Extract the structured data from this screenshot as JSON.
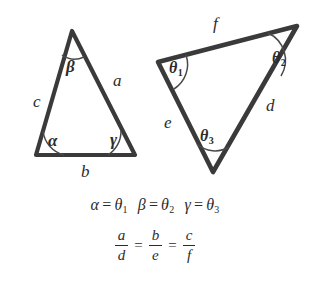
{
  "figure": {
    "stroke_color": "#3a3a3a",
    "text_color": "#2b2b2b",
    "background_color": "#ffffff"
  },
  "left_triangle": {
    "name": "small-triangle",
    "vertices": {
      "apex": [
        72,
        31
      ],
      "bottom_left": [
        36,
        155
      ],
      "bottom_right": [
        135,
        155
      ]
    },
    "angles": [
      {
        "id": "alpha",
        "label": "α",
        "vertex": "bottom_left"
      },
      {
        "id": "beta",
        "label": "β",
        "vertex": "apex"
      },
      {
        "id": "gamma",
        "label": "γ",
        "vertex": "bottom_right"
      }
    ],
    "sides": [
      {
        "id": "a",
        "label": "a",
        "between": "apex-bottom_right"
      },
      {
        "id": "b",
        "label": "b",
        "between": "bottom_left-bottom_right"
      },
      {
        "id": "c",
        "label": "c",
        "between": "apex-bottom_left"
      }
    ]
  },
  "right_triangle": {
    "name": "large-triangle",
    "vertices": {
      "left": [
        158,
        62
      ],
      "top_right": [
        297,
        26
      ],
      "bottom": [
        213,
        172
      ]
    },
    "angles": [
      {
        "id": "theta1",
        "label": "θ",
        "sub": "1",
        "vertex": "left"
      },
      {
        "id": "theta2",
        "label": "θ",
        "sub": "2",
        "vertex": "top_right"
      },
      {
        "id": "theta3",
        "label": "θ",
        "sub": "3",
        "vertex": "bottom"
      }
    ],
    "sides": [
      {
        "id": "d",
        "label": "d",
        "between": "top_right-bottom"
      },
      {
        "id": "e",
        "label": "e",
        "between": "left-bottom"
      },
      {
        "id": "f",
        "label": "f",
        "between": "left-top_right"
      }
    ]
  },
  "equations": {
    "angle_equalities": [
      {
        "left": "α",
        "op": "=",
        "right": "θ",
        "right_sub": "1"
      },
      {
        "left": "β",
        "op": "=",
        "right": "θ",
        "right_sub": "2"
      },
      {
        "left": "γ",
        "op": "=",
        "right": "θ",
        "right_sub": "3"
      }
    ],
    "ratio_equalities": {
      "fractions": [
        {
          "num": "a",
          "den": "d"
        },
        {
          "num": "b",
          "den": "e"
        },
        {
          "num": "c",
          "den": "f"
        }
      ],
      "operator": "="
    }
  }
}
